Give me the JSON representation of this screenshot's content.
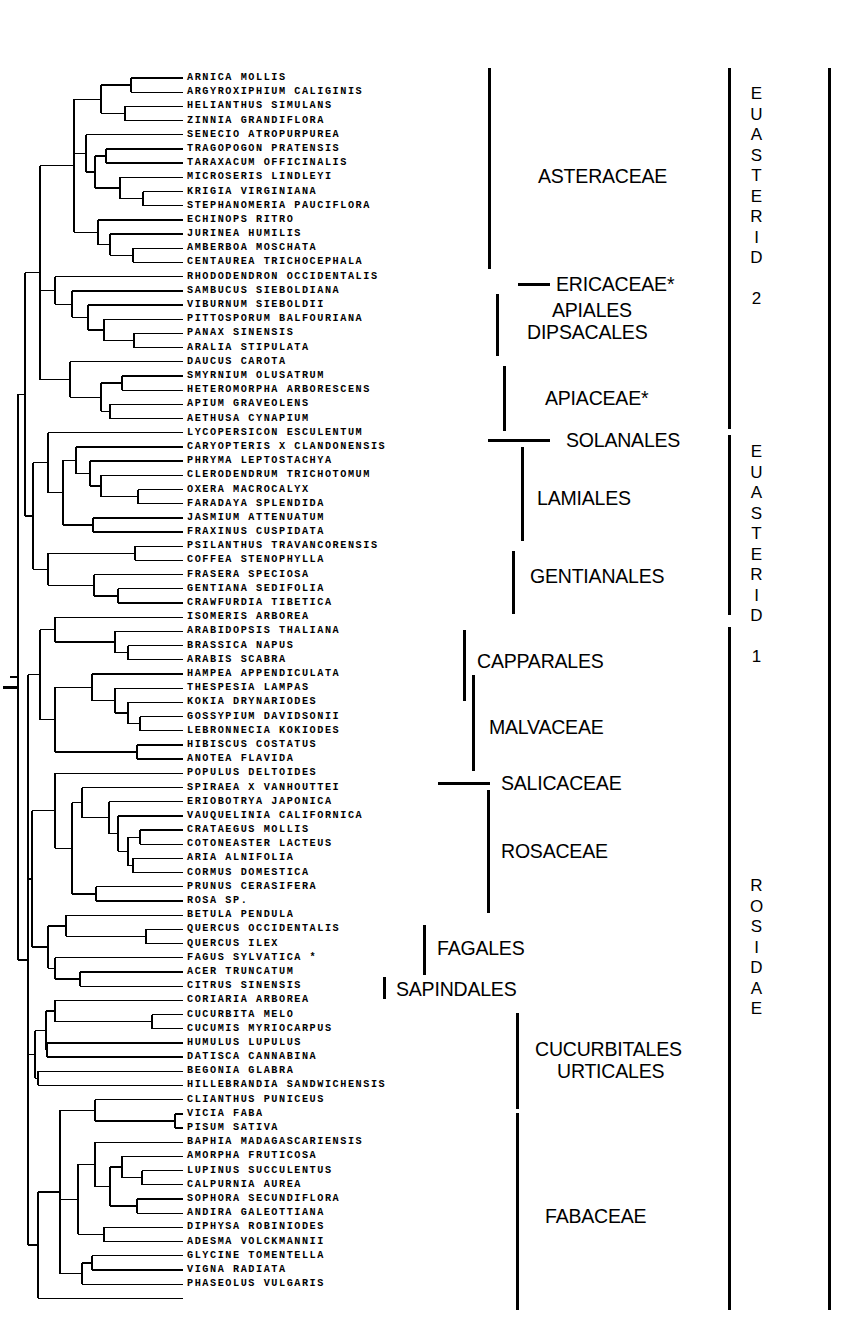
{
  "figure": {
    "type": "phylogenetic-cladogram",
    "taxa_count": 87,
    "first_label_y": 78,
    "row_spacing": 14.19,
    "label_x": 187,
    "footnote_marker": "*"
  },
  "taxa": [
    "ARNICA MOLLIS",
    "ARGYROXIPHIUM CALIGINIS",
    "HELIANTHUS SIMULANS",
    "ZINNIA GRANDIFLORA",
    "SENECIO ATROPURPUREA",
    "TRAGOPOGON PRATENSIS",
    "TARAXACUM OFFICINALIS",
    "MICROSERIS LINDLEYI",
    "KRIGIA VIRGINIANA",
    "STEPHANOMERIA PAUCIFLORA",
    "ECHINOPS RITRO",
    "JURINEA HUMILIS",
    "AMBERBOA MOSCHATA",
    "CENTAUREA TRICHOCEPHALA",
    "RHODODENDRON OCCIDENTALIS",
    "SAMBUCUS SIEBOLDIANA",
    "VIBURNUM SIEBOLDII",
    "PITTOSPORUM BALFOURIANA",
    "PANAX SINENSIS",
    "ARALIA STIPULATA",
    "DAUCUS CAROTA",
    "SMYRNIUM OLUSATRUM",
    "HETEROMORPHA ARBORESCENS",
    "APIUM GRAVEOLENS",
    "AETHUSA CYNAPIUM",
    "LYCOPERSICON ESCULENTUM",
    "CARYOPTERIS X CLANDONENSIS",
    "PHRYMA LEPTOSTACHYA",
    "CLERODENDRUM TRICHOTOMUM",
    "OXERA MACROCALYX",
    "FARADAYA SPLENDIDA",
    "JASMIUM ATTENUATUM",
    "FRAXINUS CUSPIDATA",
    "PSILANTHUS TRAVANCORENSIS",
    "COFFEA STENOPHYLLA",
    "FRASERA SPECIOSA",
    "GENTIANA SEDIFOLIA",
    "CRAWFURDIA TIBETICA",
    "ISOMERIS ARBOREA",
    "ARABIDOPSIS THALIANA",
    "BRASSICA NAPUS",
    "ARABIS SCABRA",
    "HAMPEA APPENDICULATA",
    "THESPESIA LAMPAS",
    "KOKIA DRYNARIODES",
    "GOSSYPIUM DAVIDSONII",
    "LEBRONNECIA KOKIODES",
    "HIBISCUS COSTATUS",
    "ANOTEA FLAVIDA",
    "POPULUS DELTOIDES",
    "SPIRAEA X VANHOUTTEI",
    "ERIOBOTRYA JAPONICA",
    "VAUQUELINIA CALIFORNICA",
    "CRATAEGUS MOLLIS",
    "COTONEASTER LACTEUS",
    "ARIA ALNIFOLIA",
    "CORMUS DOMESTICA",
    "PRUNUS CERASIFERA",
    "ROSA SP.",
    "BETULA PENDULA",
    "QUERCUS OCCIDENTALIS",
    "QUERCUS ILEX",
    "FAGUS SYLVATICA *",
    "ACER TRUNCATUM",
    "CITRUS SINENSIS",
    "CORIARIA ARBOREA",
    "CUCURBITA MELO",
    "CUCUMIS MYRIOCARPUS",
    "HUMULUS LUPULUS",
    "DATISCA CANNABINA",
    "BEGONIA GLABRA",
    "HILLEBRANDIA SANDWICHENSIS",
    "CLIANTHUS PUNICEUS",
    "VICIA FABA",
    "PISUM SATIVA",
    "BAPHIA MADAGASCARIENSIS",
    "AMORPHA FRUTICOSA",
    "LUPINUS SUCCULENTUS",
    "CALPURNIA AUREA",
    "SOPHORA SECUNDIFLORA",
    "ANDIRA GALEOTTIANA",
    "DIPHYSA ROBINIODES",
    "ADESMA VOLCKMANNII",
    "GLYCINE TOMENTELLA",
    "VIGNA RADIATA",
    "PHASEOLUS VULGARIS"
  ],
  "clade_labels": [
    {
      "name": "ASTERACEAE",
      "x": 538,
      "y": 176,
      "orient": "horizontal"
    },
    {
      "name": "ERICACEAE*",
      "x": 556,
      "y": 284,
      "orient": "horizontal"
    },
    {
      "name": "APIALES",
      "x": 552,
      "y": 310,
      "orient": "horizontal"
    },
    {
      "name": "DIPSACALES",
      "x": 527,
      "y": 332,
      "orient": "horizontal"
    },
    {
      "name": "APIACEAE*",
      "x": 545,
      "y": 398,
      "orient": "horizontal"
    },
    {
      "name": "SOLANALES",
      "x": 566,
      "y": 440,
      "orient": "horizontal"
    },
    {
      "name": "LAMIALES",
      "x": 537,
      "y": 498,
      "orient": "horizontal"
    },
    {
      "name": "GENTIANALES",
      "x": 530,
      "y": 576,
      "orient": "horizontal"
    },
    {
      "name": "CAPPARALES",
      "x": 477,
      "y": 661,
      "orient": "horizontal"
    },
    {
      "name": "MALVACEAE",
      "x": 489,
      "y": 727,
      "orient": "horizontal"
    },
    {
      "name": "SALICACEAE",
      "x": 501,
      "y": 783,
      "orient": "horizontal"
    },
    {
      "name": "ROSACEAE",
      "x": 501,
      "y": 851,
      "orient": "horizontal"
    },
    {
      "name": "FAGALES",
      "x": 437,
      "y": 948,
      "orient": "horizontal"
    },
    {
      "name": "SAPINDALES",
      "x": 396,
      "y": 989,
      "orient": "horizontal"
    },
    {
      "name": "CUCURBITALES",
      "x": 535,
      "y": 1049,
      "orient": "horizontal"
    },
    {
      "name": "URTICALES",
      "x": 557,
      "y": 1071,
      "orient": "horizontal"
    },
    {
      "name": "FABACEAE",
      "x": 545,
      "y": 1216,
      "orient": "horizontal"
    },
    {
      "name": "EUASTERID 2",
      "x": 748,
      "y": 84,
      "orient": "vertical"
    },
    {
      "name": "EUASTERID 1",
      "x": 748,
      "y": 442,
      "orient": "vertical"
    },
    {
      "name": "ROSIDAE",
      "x": 748,
      "y": 876,
      "orient": "vertical"
    }
  ],
  "brackets": [
    {
      "name": "asteraceae-bracket",
      "x": 488,
      "y": 68,
      "height": 201
    },
    {
      "name": "apiales-bracket",
      "x": 496,
      "y": 294,
      "height": 62
    },
    {
      "name": "apiaceae-bracket",
      "x": 503,
      "y": 366,
      "height": 65
    },
    {
      "name": "lamiales-bracket",
      "x": 521,
      "y": 447,
      "height": 94
    },
    {
      "name": "gentianales-bracket",
      "x": 512,
      "y": 551,
      "height": 63
    },
    {
      "name": "capparales-bracket",
      "x": 463,
      "y": 630,
      "height": 71
    },
    {
      "name": "malvacaeae-bracket",
      "x": 472,
      "y": 675,
      "height": 96
    },
    {
      "name": "rosaceae-bracket",
      "x": 487,
      "y": 790,
      "height": 123
    },
    {
      "name": "fagales-bracket",
      "x": 423,
      "y": 925,
      "height": 50
    },
    {
      "name": "sapindales-bracket",
      "x": 383,
      "y": 977,
      "height": 22
    },
    {
      "name": "cucurbitales-bracket",
      "x": 516,
      "y": 1013,
      "height": 96
    },
    {
      "name": "fabaceae-bracket",
      "x": 516,
      "y": 1113,
      "height": 197
    },
    {
      "name": "euasterid2-bracket",
      "x": 728,
      "y": 68,
      "height": 361
    },
    {
      "name": "euasterid1-bracket",
      "x": 728,
      "y": 435,
      "height": 180
    },
    {
      "name": "rosidae-bracket",
      "x": 728,
      "y": 627,
      "height": 683
    },
    {
      "name": "outer-bracket",
      "x": 828,
      "y": 68,
      "height": 1242
    }
  ],
  "dashes": [
    {
      "name": "ericaceae-dash",
      "x": 518,
      "y": 283,
      "width": 32
    },
    {
      "name": "solanales-dash",
      "x": 488,
      "y": 439,
      "width": 62
    },
    {
      "name": "salicaceae-dash",
      "x": 438,
      "y": 782,
      "width": 52
    },
    {
      "name": "root-tick",
      "x": 3,
      "y": 686,
      "width": 14
    }
  ],
  "colors": {
    "ink": "#000000",
    "background": "#ffffff"
  }
}
